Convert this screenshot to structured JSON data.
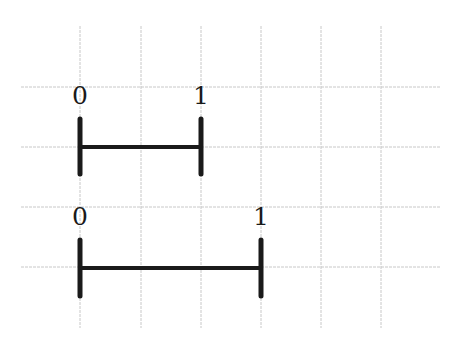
{
  "diagram": {
    "type": "number-line-segments",
    "grid": {
      "color": "#c8c8c8",
      "x_lines": [
        80,
        141,
        201,
        261,
        321,
        381
      ],
      "y_lines": [
        87,
        147,
        207,
        267
      ],
      "x_extent": [
        21,
        441
      ],
      "y_extent": [
        26,
        328
      ]
    },
    "stroke_color": "#1a1a1a",
    "segments": [
      {
        "name": "segment-short",
        "start_label": "0",
        "end_label": "1",
        "x_start": 80,
        "x_end": 201,
        "y": 147,
        "tick_top": 119,
        "tick_bottom": 174,
        "label_y": 104
      },
      {
        "name": "segment-long",
        "start_label": "0",
        "end_label": "1",
        "x_start": 80,
        "x_end": 261,
        "y": 268,
        "tick_top": 240,
        "tick_bottom": 296,
        "label_y": 225
      }
    ]
  }
}
